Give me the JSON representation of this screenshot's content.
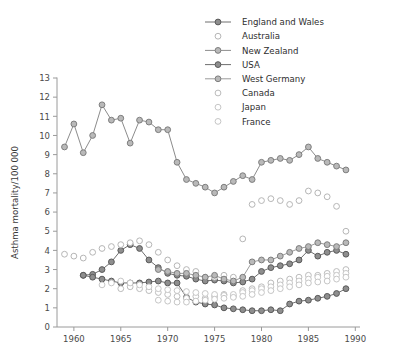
{
  "chart_data": {
    "type": "line",
    "title": "",
    "xlabel": "",
    "ylabel": "Asthma mortality/100 000",
    "xlim": [
      1958.2,
      1990.5
    ],
    "ylim": [
      0,
      13
    ],
    "xticks": [
      1960,
      1965,
      1970,
      1975,
      1980,
      1985,
      1990
    ],
    "yticks": [
      0,
      1,
      2,
      3,
      4,
      5,
      6,
      7,
      8,
      9,
      10,
      11,
      12,
      13
    ],
    "grid": false,
    "legend_position": "top-right",
    "series": [
      {
        "name": "England and Wales",
        "marker": "filled-circle",
        "color": "#6f6f6f",
        "connected": true,
        "x": [
          1961,
          1962,
          1963,
          1964,
          1965,
          1966,
          1967,
          1968,
          1969,
          1970,
          1971,
          1972,
          1973,
          1974,
          1975,
          1976,
          1977,
          1978,
          1979,
          1980,
          1981,
          1982,
          1983,
          1984,
          1985,
          1986,
          1987,
          1988,
          1989
        ],
        "values": [
          2.7,
          2.75,
          3.0,
          3.4,
          4.0,
          4.3,
          4.1,
          3.5,
          3.1,
          2.8,
          2.7,
          2.65,
          2.5,
          2.4,
          2.45,
          2.4,
          2.3,
          2.35,
          2.5,
          2.9,
          3.1,
          3.2,
          3.3,
          3.5,
          4.0,
          3.7,
          3.9,
          4.0,
          3.8
        ]
      },
      {
        "name": "Australia",
        "marker": "open-circle",
        "color": "#b6b6b6",
        "connected": false,
        "x": [
          1959,
          1960,
          1961,
          1962,
          1963,
          1964,
          1965,
          1966,
          1967,
          1968,
          1969,
          1970,
          1971,
          1972,
          1973,
          1974,
          1975,
          1976,
          1977,
          1978,
          1979,
          1980,
          1981,
          1982,
          1983,
          1984,
          1985,
          1986,
          1987,
          1988,
          1989
        ],
        "values": [
          3.8,
          3.7,
          3.6,
          3.9,
          4.1,
          4.2,
          4.3,
          4.4,
          4.5,
          4.3,
          3.9,
          3.5,
          3.2,
          3.0,
          2.9,
          2.6,
          2.6,
          2.7,
          2.6,
          4.6,
          6.4,
          6.6,
          6.7,
          6.6,
          6.4,
          6.6,
          7.1,
          7.0,
          6.8,
          6.3,
          5.0
        ]
      },
      {
        "name": "New Zealand",
        "marker": "shaded-circle",
        "color": "#8c8c8c",
        "connected": true,
        "x": [
          1959,
          1960,
          1961,
          1962,
          1963,
          1964,
          1965,
          1966,
          1967,
          1968,
          1969,
          1970,
          1971,
          1972,
          1973,
          1974,
          1975,
          1976,
          1977,
          1978,
          1979,
          1980,
          1981,
          1982,
          1983,
          1984,
          1985,
          1986,
          1987,
          1988,
          1989
        ],
        "values": [
          9.4,
          10.6,
          9.1,
          10.0,
          11.6,
          10.8,
          10.9,
          9.6,
          10.8,
          10.7,
          10.3,
          10.3,
          8.6,
          7.7,
          7.5,
          7.3,
          7.0,
          7.3,
          7.6,
          7.9,
          7.7,
          8.6,
          8.7,
          8.8,
          8.7,
          9.0,
          9.4,
          8.8,
          8.6,
          8.4,
          8.2
        ]
      },
      {
        "name": "USA",
        "marker": "filled-circle",
        "color": "#6f6f6f",
        "connected": true,
        "x": [
          1961,
          1962,
          1963,
          1964,
          1965,
          1966,
          1967,
          1968,
          1969,
          1970,
          1971,
          1972,
          1973,
          1974,
          1975,
          1976,
          1977,
          1978,
          1979,
          1980,
          1981,
          1982,
          1983,
          1984,
          1985,
          1986,
          1987,
          1988,
          1989
        ],
        "values": [
          2.7,
          2.6,
          2.5,
          2.4,
          2.3,
          2.3,
          2.3,
          2.35,
          2.4,
          2.3,
          2.3,
          1.55,
          1.3,
          1.2,
          1.15,
          1.0,
          0.95,
          0.9,
          0.85,
          0.85,
          0.9,
          0.85,
          1.2,
          1.35,
          1.4,
          1.5,
          1.6,
          1.75,
          2.0
        ]
      },
      {
        "name": "West Germany",
        "marker": "shaded-circle",
        "color": "#9b9b9b",
        "connected": true,
        "x": [
          1969,
          1970,
          1971,
          1972,
          1973,
          1974,
          1975,
          1976,
          1977,
          1978,
          1979,
          1980,
          1981,
          1982,
          1983,
          1984,
          1985,
          1986,
          1987,
          1988,
          1989
        ],
        "values": [
          3.0,
          2.9,
          2.8,
          2.8,
          2.7,
          2.6,
          2.7,
          2.5,
          2.4,
          2.6,
          3.4,
          3.5,
          3.5,
          3.7,
          3.9,
          4.1,
          4.2,
          4.4,
          4.3,
          4.2,
          4.4
        ]
      },
      {
        "name": "Canada",
        "marker": "open-circle",
        "color": "#bcbcbc",
        "connected": false,
        "x": [
          1965,
          1966,
          1967,
          1968,
          1969,
          1970,
          1971,
          1972,
          1973,
          1974,
          1975,
          1976,
          1977,
          1978,
          1979,
          1980,
          1981,
          1982,
          1983,
          1984,
          1985,
          1986,
          1987,
          1988,
          1989
        ],
        "values": [
          2.0,
          2.1,
          2.0,
          1.9,
          1.8,
          1.7,
          1.6,
          1.5,
          1.6,
          1.5,
          1.6,
          1.7,
          1.6,
          1.9,
          2.0,
          2.1,
          2.3,
          2.4,
          2.5,
          2.6,
          2.7,
          2.7,
          2.8,
          2.9,
          3.0
        ]
      },
      {
        "name": "Japan",
        "marker": "open-circle",
        "color": "#c6c6c6",
        "connected": false,
        "x": [
          1963,
          1964,
          1965,
          1966,
          1967,
          1968,
          1969,
          1970,
          1971,
          1972,
          1973,
          1974,
          1975,
          1976,
          1977,
          1978,
          1979,
          1980,
          1981,
          1982,
          1983,
          1984,
          1985,
          1986,
          1987,
          1988,
          1989
        ],
        "values": [
          2.2,
          2.3,
          2.4,
          2.3,
          2.2,
          2.1,
          2.0,
          1.95,
          1.9,
          1.85,
          1.8,
          1.75,
          1.7,
          1.65,
          1.7,
          1.8,
          1.9,
          2.0,
          2.1,
          2.2,
          2.3,
          2.4,
          2.5,
          2.6,
          2.65,
          2.7,
          2.8
        ]
      },
      {
        "name": "France",
        "marker": "open-circle",
        "color": "#c6c6c6",
        "connected": false,
        "x": [
          1969,
          1970,
          1971,
          1972,
          1973,
          1974,
          1975,
          1976,
          1977,
          1978,
          1979,
          1980,
          1981,
          1982,
          1983,
          1984,
          1985,
          1986,
          1987,
          1988,
          1989
        ],
        "values": [
          1.4,
          1.35,
          1.3,
          1.3,
          1.35,
          1.4,
          1.45,
          1.5,
          1.55,
          1.6,
          1.7,
          1.8,
          1.9,
          2.0,
          2.1,
          2.2,
          2.3,
          2.35,
          2.4,
          2.5,
          2.6
        ]
      }
    ]
  }
}
